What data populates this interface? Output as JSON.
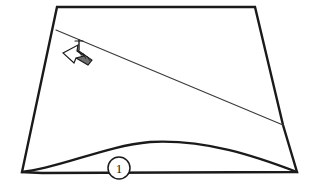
{
  "figure": {
    "domain": "technical-line-drawing",
    "canvas": {
      "width": 315,
      "height": 196
    },
    "background_color": "#ffffff",
    "line_color": "#1a1a1a",
    "secondary_line_color": "#3a3a3a"
  },
  "callouts": [
    {
      "id": "callout-1",
      "label": "1",
      "shape": "circle",
      "center_x": 119,
      "center_y": 168,
      "radius": 11
    }
  ],
  "annotations": [
    {
      "id": "direction-arrow",
      "name": "hatched-direction-arrow",
      "description": "Hatched arrow pointing toward lower-left",
      "tip_x": 63,
      "tip_y": 53,
      "tail_x": 92,
      "tail_y": 62
    }
  ],
  "geometry": {
    "outline": {
      "name": "panel-outline",
      "top_left": {
        "x": 57,
        "y": 7
      },
      "top_right": {
        "x": 255,
        "y": 7
      },
      "right_bend": {
        "x": 283,
        "y": 125
      },
      "bottom_right": {
        "x": 297,
        "y": 172
      },
      "bottom_left_notch": {
        "x": 42,
        "y": 173
      },
      "bottom_left": {
        "x": 22,
        "y": 172
      }
    },
    "diagonal_line": {
      "name": "panel-crease-line",
      "start_x": 56,
      "start_y": 30,
      "end_x": 283,
      "end_y": 125
    },
    "bottom_curve": {
      "name": "panel-bottom-edge-curve",
      "start_x": 22,
      "start_y": 172,
      "peak_x": 150,
      "peak_y": 142,
      "end_x": 297,
      "end_y": 172
    }
  }
}
